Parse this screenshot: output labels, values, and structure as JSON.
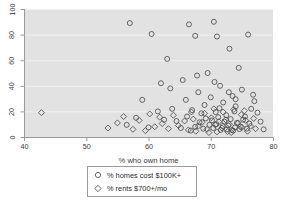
{
  "chart_data": {
    "type": "scatter",
    "title": "",
    "xlabel": "% who own home",
    "ylabel": "",
    "xlim": [
      40,
      80
    ],
    "ylim": [
      0,
      100
    ],
    "xticks": [
      40,
      50,
      60,
      70,
      80
    ],
    "yticks": [
      0,
      20,
      40,
      60,
      80,
      100
    ],
    "xticklabels": [
      "40",
      "50",
      "60",
      "70",
      "80"
    ],
    "yticklabels": [
      "0",
      "20",
      "40",
      "60",
      "80",
      "100"
    ],
    "grid": "horizontal",
    "plot_background": "#e2e2e2",
    "page_background": "#ffffff",
    "marker_color": "#4d4d4d",
    "legend": {
      "position": "below-axis-centered",
      "entries": [
        {
          "label": "% homes cost $100K+",
          "marker": "circle"
        },
        {
          "label": "% rents $700+/mo",
          "marker": "diamond"
        }
      ]
    },
    "series": [
      {
        "name": "% homes cost $100K+",
        "marker": "circle",
        "points": [
          [
            57.0,
            89.0
          ],
          [
            60.5,
            80.5
          ],
          [
            62.0,
            42.0
          ],
          [
            66.5,
            88.0
          ],
          [
            67.5,
            79.0
          ],
          [
            70.5,
            90.0
          ],
          [
            71.0,
            78.5
          ],
          [
            73.0,
            69.0
          ],
          [
            63.0,
            61.0
          ],
          [
            69.5,
            50.0
          ],
          [
            74.5,
            54.0
          ],
          [
            76.0,
            80.0
          ],
          [
            63.5,
            38.0
          ],
          [
            65.5,
            44.5
          ],
          [
            68.0,
            35.0
          ],
          [
            71.5,
            40.0
          ],
          [
            73.5,
            32.0
          ],
          [
            75.0,
            37.0
          ],
          [
            77.0,
            28.0
          ],
          [
            66.0,
            29.0
          ],
          [
            69.0,
            25.0
          ],
          [
            70.0,
            31.0
          ],
          [
            72.0,
            27.0
          ],
          [
            74.0,
            24.0
          ],
          [
            76.5,
            22.0
          ],
          [
            67.0,
            21.0
          ],
          [
            68.5,
            18.5
          ],
          [
            70.8,
            19.5
          ],
          [
            72.5,
            17.0
          ],
          [
            73.8,
            20.0
          ],
          [
            75.5,
            16.0
          ],
          [
            77.5,
            19.0
          ],
          [
            69.2,
            14.5
          ],
          [
            70.2,
            13.0
          ],
          [
            71.2,
            15.5
          ],
          [
            72.2,
            12.0
          ],
          [
            73.2,
            14.0
          ],
          [
            74.2,
            11.0
          ],
          [
            75.2,
            13.5
          ],
          [
            76.2,
            10.5
          ],
          [
            68.2,
            11.5
          ],
          [
            69.8,
            9.5
          ],
          [
            70.9,
            10.0
          ],
          [
            71.9,
            8.5
          ],
          [
            72.8,
            9.0
          ],
          [
            73.9,
            7.5
          ],
          [
            74.8,
            8.0
          ],
          [
            75.8,
            6.5
          ],
          [
            67.5,
            8.0
          ],
          [
            68.8,
            6.5
          ],
          [
            70.4,
            7.0
          ],
          [
            71.6,
            5.5
          ],
          [
            72.6,
            6.0
          ],
          [
            73.6,
            5.0
          ],
          [
            74.6,
            6.2
          ],
          [
            66.8,
            5.0
          ],
          [
            78.0,
            12.0
          ],
          [
            78.5,
            6.0
          ],
          [
            64.5,
            12.5
          ],
          [
            65.2,
            7.0
          ],
          [
            61.5,
            20.0
          ],
          [
            59.0,
            29.0
          ],
          [
            58.0,
            15.0
          ],
          [
            56.5,
            9.5
          ],
          [
            62.5,
            13.5
          ],
          [
            60.0,
            7.5
          ],
          [
            63.8,
            22.0
          ],
          [
            66.2,
            16.0
          ],
          [
            71.4,
            22.5
          ],
          [
            74.0,
            29.5
          ],
          [
            72.9,
            35.0
          ],
          [
            70.6,
            43.0
          ],
          [
            67.8,
            48.0
          ],
          [
            76.8,
            33.0
          ]
        ]
      },
      {
        "name": "% rents $700+/mo",
        "marker": "diamond",
        "points": [
          [
            42.8,
            19.0
          ],
          [
            55.0,
            11.0
          ],
          [
            57.5,
            6.0
          ],
          [
            58.5,
            13.0
          ],
          [
            60.2,
            18.0
          ],
          [
            61.0,
            8.0
          ],
          [
            62.2,
            10.5
          ],
          [
            63.2,
            6.5
          ],
          [
            64.0,
            17.0
          ],
          [
            64.8,
            9.0
          ],
          [
            65.8,
            12.5
          ],
          [
            66.4,
            5.5
          ],
          [
            67.2,
            14.0
          ],
          [
            68.0,
            8.5
          ],
          [
            68.6,
            11.5
          ],
          [
            69.4,
            6.0
          ],
          [
            70.1,
            15.0
          ],
          [
            70.7,
            9.5
          ],
          [
            71.3,
            12.0
          ],
          [
            71.8,
            7.0
          ],
          [
            72.4,
            13.5
          ],
          [
            73.0,
            10.0
          ],
          [
            73.4,
            5.5
          ],
          [
            74.4,
            11.0
          ],
          [
            75.0,
            7.5
          ],
          [
            75.6,
            13.0
          ],
          [
            76.4,
            8.5
          ],
          [
            77.2,
            6.5
          ],
          [
            69.0,
            18.5
          ],
          [
            72.0,
            19.5
          ],
          [
            74.9,
            17.5
          ],
          [
            76.9,
            14.5
          ],
          [
            53.5,
            7.0
          ],
          [
            56.0,
            16.0
          ],
          [
            59.5,
            5.0
          ],
          [
            61.8,
            15.5
          ],
          [
            66.9,
            19.5
          ],
          [
            70.5,
            22.0
          ],
          [
            73.7,
            21.5
          ],
          [
            75.4,
            20.5
          ],
          [
            67.6,
            4.5
          ],
          [
            71.0,
            4.0
          ],
          [
            73.3,
            3.5
          ],
          [
            75.9,
            4.5
          ],
          [
            69.7,
            3.5
          ],
          [
            72.7,
            4.2
          ]
        ]
      }
    ]
  }
}
